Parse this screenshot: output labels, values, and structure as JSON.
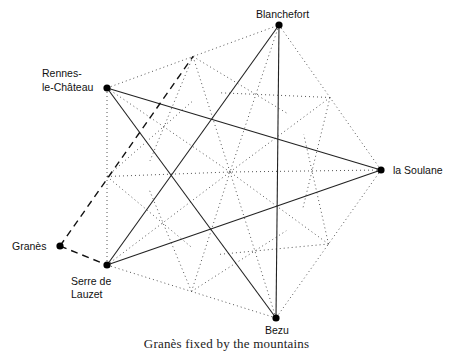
{
  "figure": {
    "caption": "Granès fixed by the mountains",
    "colors": {
      "ink": "#111111",
      "dotted": "#555555",
      "background": "#ffffff"
    },
    "center": {
      "x": 230,
      "y": 172
    },
    "points": [
      {
        "id": "blanchefort",
        "label": "Blanchefort",
        "x": 279,
        "y": 25,
        "label_lines": [
          "Blanchefort"
        ]
      },
      {
        "id": "la-soulane",
        "label": "la Soulane",
        "x": 381,
        "y": 170,
        "label_lines": [
          "la Soulane"
        ]
      },
      {
        "id": "bezu",
        "label": "Bezu",
        "x": 276,
        "y": 318,
        "label_lines": [
          "Bezu"
        ]
      },
      {
        "id": "serre-de-lauzet",
        "label": "Serre de Lauzet",
        "x": 107,
        "y": 265,
        "label_lines": [
          "Serre de",
          "Lauzet"
        ]
      },
      {
        "id": "rennes-le-chateau",
        "label": "Rennes-le-Château",
        "x": 107,
        "y": 88,
        "label_lines": [
          "Rennes-",
          "le-Château"
        ]
      },
      {
        "id": "granes",
        "label": "Granès",
        "x": 60,
        "y": 246,
        "label_lines": [
          "Granès"
        ]
      }
    ],
    "labels": {
      "blanchefort": "Blanchefort",
      "la_soulane": "la Soulane",
      "bezu": "Bezu",
      "serre_line1": "Serre de",
      "serre_line2": "Lauzet",
      "rennes_line1": "Rennes-",
      "rennes_line2": "le-Château",
      "granes": "Granès"
    },
    "solid_star_edges": [
      [
        "blanchefort",
        "serre-de-lauzet"
      ],
      [
        "blanchefort",
        "bezu"
      ],
      [
        "rennes-le-chateau",
        "la-soulane"
      ],
      [
        "rennes-le-chateau",
        "bezu"
      ],
      [
        "serre-de-lauzet",
        "la-soulane"
      ]
    ],
    "dotted_pentagon_edges": [
      [
        "blanchefort",
        "la-soulane"
      ],
      [
        "la-soulane",
        "bezu"
      ],
      [
        "bezu",
        "serre-de-lauzet"
      ],
      [
        "serre-de-lauzet",
        "rennes-le-chateau"
      ],
      [
        "rennes-le-chateau",
        "blanchefort"
      ]
    ],
    "dashed_edges": [
      [
        "granes",
        "serre-de-lauzet"
      ],
      [
        "granes",
        "midpoint:rennes-le-chateau-blanchefort"
      ]
    ]
  }
}
